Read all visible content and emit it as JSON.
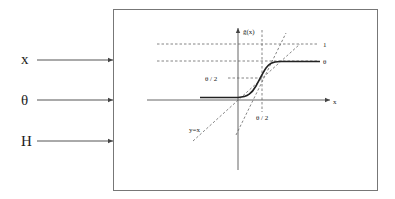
{
  "diagram": {
    "inputs": [
      {
        "label": "x"
      },
      {
        "label": "θ"
      },
      {
        "label": "H"
      }
    ],
    "plot": {
      "y_axis_label": "g̃(x)",
      "x_axis_label": "x",
      "level_labels": {
        "one": "1",
        "theta": "θ"
      },
      "half_theta_y_label": "θ / 2",
      "half_theta_x_label": "θ / 2",
      "identity_line_label": "y=x"
    }
  },
  "colors": {
    "stroke": "#555555",
    "curve": "#222222",
    "box": "#777777"
  }
}
